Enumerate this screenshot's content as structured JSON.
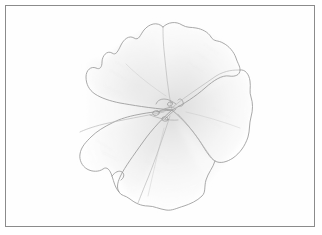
{
  "image": {
    "kind": "pencil-drawing",
    "subject": "flower-bloom-face-on",
    "medium": "graphite pencil on white paper",
    "width": 322,
    "height": 235,
    "background_color": "#ffffff",
    "paper_color": "#fefefe"
  },
  "frame": {
    "present": true,
    "style": "thin-rectangle",
    "line_color": "#8b8b8b",
    "line_width": 1,
    "left": 5,
    "top": 5,
    "width": 310,
    "height": 222
  },
  "drawing": {
    "outline_color": "#9a9a9a",
    "outline_color_dark": "#7c7c7c",
    "shade_light": "#f4f4f4",
    "shade_mid": "#eaeaea",
    "shade_deep": "#dedede",
    "vein_color": "#b9b9b9",
    "center": {
      "x": 172,
      "y": 110
    },
    "bounds": {
      "left": 78,
      "top": 20,
      "right": 252,
      "bottom": 209
    },
    "petal_count": 5,
    "petal_edge": "wavy-scalloped",
    "petals": [
      {
        "name": "petal-upper-left",
        "label": "Upper-left petal"
      },
      {
        "name": "petal-upper-right",
        "label": "Upper-right petal"
      },
      {
        "name": "petal-right",
        "label": "Right petal"
      },
      {
        "name": "petal-lower",
        "label": "Lower petal"
      },
      {
        "name": "petal-left",
        "label": "Left petal"
      }
    ],
    "center_detail": {
      "name": "stamens-and-pistil",
      "label": "Stamen cluster at flower throat"
    }
  }
}
